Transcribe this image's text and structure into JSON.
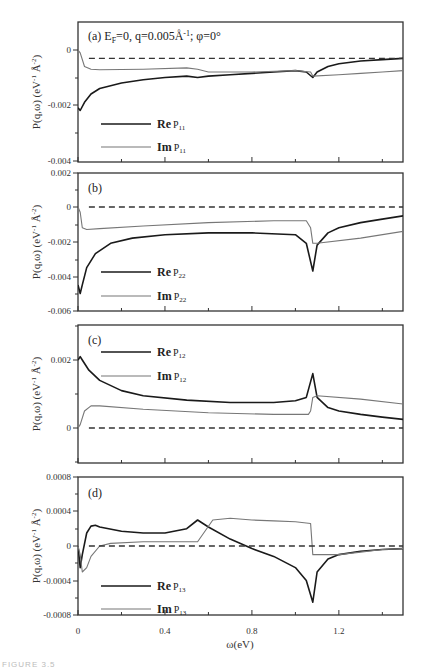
{
  "figure": {
    "caption": "FIGURE 3.5",
    "xlabel": "ω(eV)",
    "x_ticks": [
      "0",
      "0.4",
      "0.8",
      "1.2"
    ]
  },
  "chart_data": [
    {
      "type": "line",
      "panel": "(a)",
      "title": "(a) E_F=0, q=0.005Å⁻¹; φ=0°",
      "xlabel": "ω(eV)",
      "ylabel": "P(q,ω) (eV⁻¹Å⁻²)",
      "xlim": [
        0,
        1.5
      ],
      "ylim": [
        -0.004,
        0.0008
      ],
      "y_ticks": [
        "0",
        "-0.002",
        "-0.004"
      ],
      "series": [
        {
          "name": "Re P11",
          "style": "thick-black",
          "x": [
            0,
            0.01,
            0.03,
            0.06,
            0.1,
            0.2,
            0.3,
            0.4,
            0.5,
            0.55,
            0.6,
            0.7,
            0.8,
            0.9,
            1.0,
            1.05,
            1.08,
            1.1,
            1.15,
            1.2,
            1.3,
            1.4,
            1.5
          ],
          "y": [
            -0.0021,
            -0.0022,
            -0.0019,
            -0.0016,
            -0.0014,
            -0.0012,
            -0.00108,
            -0.001,
            -0.00095,
            -0.001,
            -0.00095,
            -0.0009,
            -0.00085,
            -0.0008,
            -0.00075,
            -0.0008,
            -0.001,
            -0.0008,
            -0.0006,
            -0.0005,
            -0.0004,
            -0.00035,
            -0.0003
          ]
        },
        {
          "name": "Im P11",
          "style": "thin-gray",
          "x": [
            0,
            0.01,
            0.03,
            0.06,
            0.1,
            0.3,
            0.5,
            0.55,
            0.6,
            0.8,
            1.0,
            1.07,
            1.08,
            1.2,
            1.3,
            1.4,
            1.5
          ],
          "y": [
            0,
            -0.0001,
            -0.0006,
            -0.0007,
            -0.00072,
            -0.0007,
            -0.00065,
            -0.0007,
            -0.0008,
            -0.0008,
            -0.00075,
            -0.0008,
            -0.00095,
            -0.0009,
            -0.00085,
            -0.0008,
            -0.00075
          ]
        },
        {
          "name": "zero",
          "style": "dashed",
          "x": [
            0.05,
            1.5
          ],
          "y": [
            -0.0003,
            -0.0003
          ]
        }
      ],
      "legend": [
        "Re P11",
        "Im P11"
      ]
    },
    {
      "type": "line",
      "panel": "(b)",
      "title": "(b)",
      "ylabel": "P(q,ω) (eV⁻¹Å⁻²)",
      "xlim": [
        0,
        1.5
      ],
      "ylim": [
        -0.006,
        0.002
      ],
      "y_ticks": [
        "0.002",
        "0",
        "-0.002",
        "-0.004",
        "-0.006"
      ],
      "series": [
        {
          "name": "Re P22",
          "style": "thick-black",
          "x": [
            0,
            0.01,
            0.02,
            0.04,
            0.08,
            0.15,
            0.25,
            0.4,
            0.6,
            0.8,
            1.0,
            1.05,
            1.08,
            1.1,
            1.15,
            1.2,
            1.3,
            1.4,
            1.5
          ],
          "y": [
            -0.0045,
            -0.005,
            -0.0045,
            -0.0035,
            -0.0027,
            -0.0021,
            -0.0018,
            -0.0016,
            -0.0015,
            -0.0015,
            -0.0016,
            -0.0021,
            -0.0037,
            -0.0022,
            -0.0015,
            -0.0012,
            -0.0009,
            -0.0007,
            -0.0005
          ]
        },
        {
          "name": "Im P22",
          "style": "thin-gray",
          "x": [
            0,
            0.01,
            0.02,
            0.04,
            0.1,
            0.3,
            0.6,
            0.9,
            1.05,
            1.07,
            1.08,
            1.1,
            1.3,
            1.5
          ],
          "y": [
            0,
            -0.0003,
            -0.0012,
            -0.0013,
            -0.00125,
            -0.0011,
            -0.0009,
            -0.0008,
            -0.0008,
            -0.0012,
            -0.0021,
            -0.0021,
            -0.0018,
            -0.0014
          ]
        },
        {
          "name": "zero",
          "style": "dashed",
          "x": [
            0.05,
            1.5
          ],
          "y": [
            0,
            0
          ]
        }
      ],
      "legend": [
        "Re P22",
        "Im P22"
      ]
    },
    {
      "type": "line",
      "panel": "(c)",
      "title": "(c)",
      "ylabel": "P(q,ω) (eV⁻¹Å⁻²)",
      "xlim": [
        0,
        1.5
      ],
      "ylim": [
        -0.0008,
        0.0032
      ],
      "y_ticks": [
        "0.002",
        "0"
      ],
      "series": [
        {
          "name": "Re P12",
          "style": "thick-black",
          "x": [
            0,
            0.01,
            0.02,
            0.05,
            0.1,
            0.2,
            0.3,
            0.5,
            0.7,
            0.9,
            1.0,
            1.05,
            1.08,
            1.1,
            1.15,
            1.2,
            1.3,
            1.4,
            1.5
          ],
          "y": [
            0.002,
            0.0021,
            0.002,
            0.0017,
            0.0014,
            0.0011,
            0.00095,
            0.00082,
            0.00075,
            0.00075,
            0.0008,
            0.0009,
            0.0016,
            0.0009,
            0.0006,
            0.0005,
            0.0004,
            0.00032,
            0.00025
          ]
        },
        {
          "name": "Im P12",
          "style": "thin-gray",
          "x": [
            0,
            0.01,
            0.03,
            0.06,
            0.1,
            0.3,
            0.6,
            0.9,
            1.06,
            1.07,
            1.08,
            1.1,
            1.3,
            1.5
          ],
          "y": [
            0,
            0.0001,
            0.0005,
            0.00065,
            0.00065,
            0.00055,
            0.00045,
            0.0004,
            0.0004,
            0.0005,
            0.0009,
            0.00095,
            0.00085,
            0.0007
          ]
        },
        {
          "name": "zero",
          "style": "dashed",
          "x": [
            0.05,
            1.5
          ],
          "y": [
            0,
            0
          ]
        }
      ],
      "legend": [
        "Re P12",
        "Im P12"
      ]
    },
    {
      "type": "line",
      "panel": "(d)",
      "title": "(d)",
      "xlabel": "ω(eV)",
      "ylabel": "P(q,ω) (eV⁻¹Å⁻²)",
      "xlim": [
        0,
        1.5
      ],
      "ylim": [
        -0.0008,
        0.0008
      ],
      "x_ticks": [
        "0",
        "0.4",
        "0.8",
        "1.2"
      ],
      "y_ticks": [
        "0.0008",
        "0.0004",
        "0",
        "-0.0004",
        "-0.0008"
      ],
      "series": [
        {
          "name": "Re P13",
          "style": "thick-black",
          "x": [
            0,
            0.01,
            0.02,
            0.04,
            0.06,
            0.08,
            0.1,
            0.2,
            0.3,
            0.4,
            0.5,
            0.55,
            0.6,
            0.7,
            0.8,
            0.9,
            1.0,
            1.05,
            1.08,
            1.1,
            1.15,
            1.2,
            1.3,
            1.4,
            1.5
          ],
          "y": [
            0,
            -0.00025,
            -0.0001,
            0.00015,
            0.00023,
            0.00024,
            0.00022,
            0.00017,
            0.00015,
            0.00015,
            0.0002,
            0.0003,
            0.00022,
            8e-05,
            -3e-05,
            -0.00012,
            -0.00025,
            -0.0004,
            -0.00065,
            -0.0003,
            -0.00015,
            -0.0001,
            -6e-05,
            -4e-05,
            -3e-05
          ]
        },
        {
          "name": "Im P13",
          "style": "thin-gray",
          "x": [
            0,
            0.01,
            0.02,
            0.04,
            0.06,
            0.1,
            0.15,
            0.3,
            0.45,
            0.55,
            0.62,
            0.7,
            0.8,
            0.9,
            1.0,
            1.07,
            1.08,
            1.1,
            1.2,
            1.3,
            1.4,
            1.5
          ],
          "y": [
            0,
            -0.0001,
            -0.0003,
            -0.00025,
            -0.00012,
            0.0,
            3e-05,
            5e-05,
            5e-05,
            5e-05,
            0.0003,
            0.00032,
            0.0003,
            0.00029,
            0.00028,
            0.00026,
            -0.0001,
            -0.0001,
            -0.0001,
            -7e-05,
            -4e-05,
            -3e-05
          ]
        },
        {
          "name": "zero",
          "style": "dashed",
          "x": [
            0.05,
            1.5
          ],
          "y": [
            0,
            0
          ]
        }
      ],
      "legend": [
        "Re P13",
        "Im P13"
      ]
    }
  ]
}
